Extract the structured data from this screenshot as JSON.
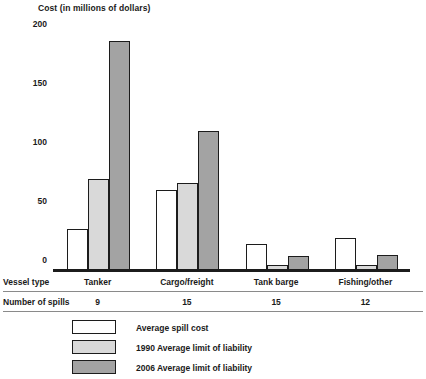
{
  "chart_data": {
    "type": "bar",
    "title": "Cost (in millions of dollars)",
    "xlabel": "Vessel type",
    "ylabel": "Cost (in millions of dollars)",
    "ylim": [
      0,
      200
    ],
    "yticks": [
      0,
      50,
      100,
      150,
      200
    ],
    "ytick_labels": [
      "0",
      "50",
      "100",
      "150",
      "200"
    ],
    "grid": false,
    "legend_position": "bottom-left",
    "categories": [
      "Tanker",
      "Cargo/freight",
      "Tank barge",
      "Fishing/other"
    ],
    "series": [
      {
        "name": "Average spill cost",
        "color": "#ffffff",
        "values": [
          35,
          68,
          22,
          27
        ]
      },
      {
        "name": "1990 Average limit of liability",
        "color": "#d9d9d9",
        "values": [
          77,
          74,
          4,
          4
        ]
      },
      {
        "name": "2006 Average limit of liability",
        "color": "#a3a3a3",
        "values": [
          194,
          118,
          12,
          13
        ]
      }
    ],
    "table": {
      "rows": [
        {
          "label": "Vessel type",
          "values": [
            "Tanker",
            "Cargo/freight",
            "Tank barge",
            "Fishing/other"
          ]
        },
        {
          "label": "Number of spills",
          "values": [
            "9",
            "15",
            "15",
            "12"
          ]
        }
      ]
    }
  }
}
